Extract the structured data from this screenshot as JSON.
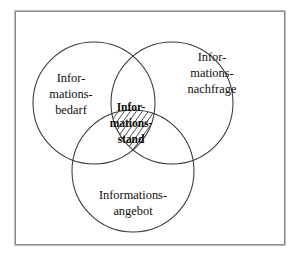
{
  "diagram": {
    "type": "venn-3-set",
    "title_visible": false,
    "background_color": "#ffffff",
    "frame": {
      "stroke_color": "#8a8a8a",
      "fill_color": "#ffffff"
    },
    "circle_stroke_color": "#3a3632",
    "text_color": "#100d0a",
    "sets": [
      {
        "id": "bedarf",
        "position": "left",
        "lines": [
          "Infor-",
          "mations-",
          "bedarf"
        ],
        "full_term": "Informationsbedarf",
        "bold": false,
        "cx": 94,
        "cy": 103,
        "r": 61
      },
      {
        "id": "nachfrage",
        "position": "right",
        "lines": [
          "Infor-",
          "mations-",
          "nachfrage"
        ],
        "full_term": "Informationsnachfrage",
        "bold": false,
        "cx": 172,
        "cy": 103,
        "r": 61
      },
      {
        "id": "angebot",
        "position": "bottom",
        "lines": [
          "Informations-",
          "angebot"
        ],
        "full_term": "Informationsangebot",
        "bold": false,
        "cx": 133,
        "cy": 171,
        "r": 61
      }
    ],
    "intersection": {
      "id": "stand",
      "position": "center",
      "lines": [
        "Infor-",
        "mations-",
        "stand"
      ],
      "full_term": "Informationsstand",
      "bold": true,
      "hatched": true,
      "hatch_direction": "diagonal-up-right",
      "cx": 133,
      "cy": 124
    },
    "labels": {
      "left_line_1": "Infor-",
      "left_line_2": "mations-",
      "left_line_3": "bedarf",
      "right_line_1": "Infor-",
      "right_line_2": "mations-",
      "right_line_3": "nachfrage",
      "bottom_line_1": "Informations-",
      "bottom_line_2": "angebot",
      "center_line_1": "Infor-",
      "center_line_2": "mations-",
      "center_line_3": "stand"
    }
  }
}
